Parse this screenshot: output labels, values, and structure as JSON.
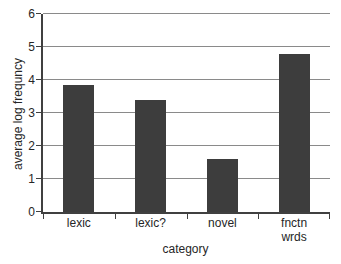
{
  "figure": {
    "background": "#ffffff"
  },
  "chart_data": {
    "type": "bar",
    "title": "",
    "categories": [
      "lexic",
      "lexic?",
      "novel",
      "fnctn\nwrds"
    ],
    "values": [
      3.85,
      3.4,
      1.6,
      4.8
    ],
    "xlabel": "category",
    "ylabel": "average log frequncy",
    "ylim": [
      0,
      6
    ],
    "yticks": [
      0,
      1,
      2,
      3,
      4,
      5,
      6
    ],
    "grid": true,
    "legend": "none",
    "colors": {
      "bar": "#3d3d3d",
      "gridline": "#8a8a8a",
      "axis": "#404040",
      "tick": "#404040",
      "text": "#262626"
    }
  }
}
